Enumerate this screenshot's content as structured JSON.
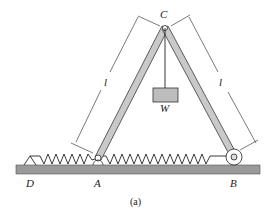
{
  "labels": {
    "C": "C",
    "W": "W",
    "A": "A",
    "B": "B",
    "D": "D",
    "l_left": "l",
    "l_right": "l",
    "caption": "(a)"
  },
  "colors": {
    "member_fill": "#c9c9c9",
    "member_stroke": "#3a3a3a",
    "ground_fill": "#9a9a9a",
    "weight_fill": "#bdbdbd",
    "line": "#222222"
  }
}
